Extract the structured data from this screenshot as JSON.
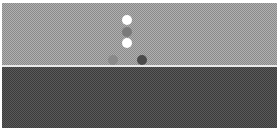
{
  "scene": {
    "top_band_color": "#a8a8a8",
    "separator_color": "#e8e8e8",
    "bottom_band_color": "#4e4e4e",
    "dots": [
      {
        "name": "dot-white-top",
        "x": 125,
        "y": 17,
        "color": "#ffffff"
      },
      {
        "name": "dot-gray-middle",
        "x": 125,
        "y": 29,
        "color": "#7a7a7a"
      },
      {
        "name": "dot-white-lower",
        "x": 125,
        "y": 40,
        "color": "#ffffff"
      },
      {
        "name": "dot-gray-left",
        "x": 111,
        "y": 57,
        "color": "#8a8a8a"
      },
      {
        "name": "dot-dark-right",
        "x": 140,
        "y": 57,
        "color": "#4a4a4a"
      }
    ]
  }
}
